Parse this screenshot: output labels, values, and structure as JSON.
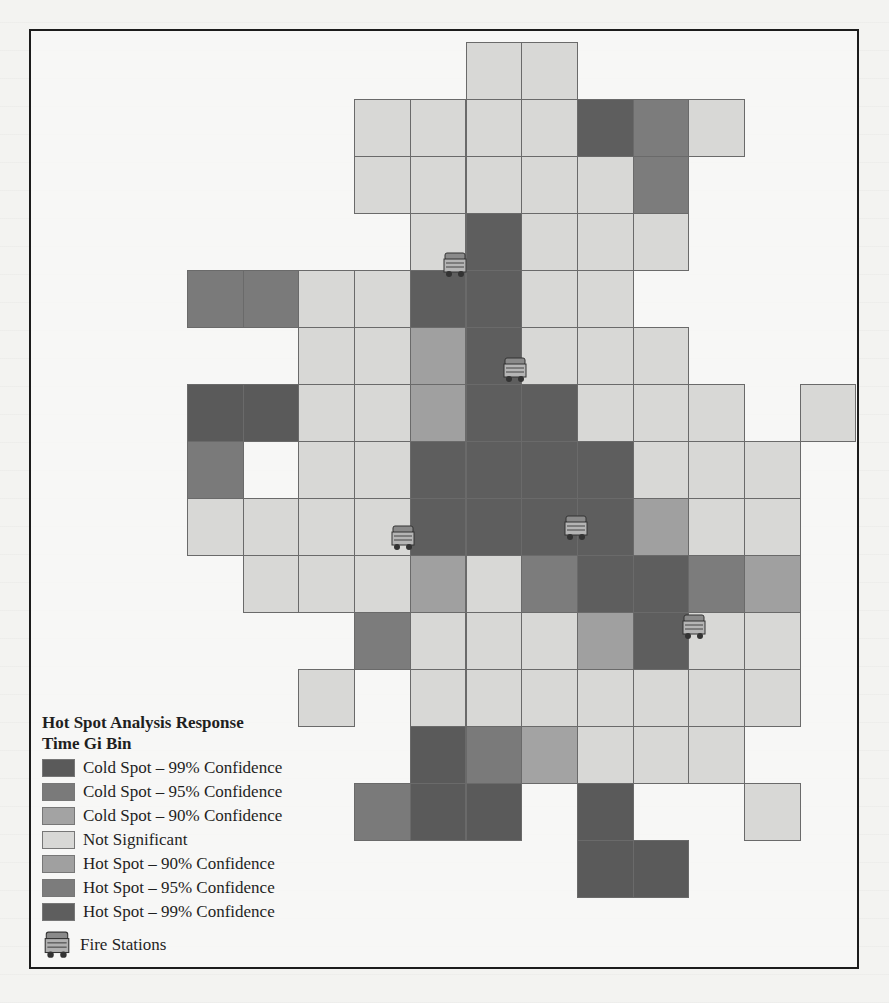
{
  "map": {
    "title": "Hot Spot Analysis Response Time Gi Bin",
    "grid": {
      "origin_x": 187,
      "origin_y": 42,
      "cell_w": 55.7,
      "cell_h": 57
    },
    "classes": {
      "C99": {
        "label": "Cold Spot – 99% Confidence",
        "color": "#5a5a5a"
      },
      "C95": {
        "label": "Cold Spot – 95% Confidence",
        "color": "#7a7a7a"
      },
      "C90": {
        "label": "Cold Spot – 90% Confidence",
        "color": "#a3a3a3"
      },
      "NS": {
        "label": "Not Significant",
        "color": "#d8d8d6"
      },
      "H90": {
        "label": "Hot Spot – 90% Confidence",
        "color": "#a0a0a0"
      },
      "H95": {
        "label": "Hot Spot – 95% Confidence",
        "color": "#7c7c7c"
      },
      "H99": {
        "label": "Hot Spot – 99% Confidence",
        "color": "#5e5e5e"
      }
    },
    "cells": [
      {
        "r": 0,
        "c": 5,
        "k": "NS"
      },
      {
        "r": 0,
        "c": 6,
        "k": "NS"
      },
      {
        "r": 1,
        "c": 3,
        "k": "NS"
      },
      {
        "r": 1,
        "c": 4,
        "k": "NS"
      },
      {
        "r": 1,
        "c": 5,
        "k": "NS"
      },
      {
        "r": 1,
        "c": 6,
        "k": "NS"
      },
      {
        "r": 1,
        "c": 7,
        "k": "H99"
      },
      {
        "r": 1,
        "c": 8,
        "k": "H95"
      },
      {
        "r": 1,
        "c": 9,
        "k": "NS"
      },
      {
        "r": 2,
        "c": 3,
        "k": "NS"
      },
      {
        "r": 2,
        "c": 4,
        "k": "NS"
      },
      {
        "r": 2,
        "c": 5,
        "k": "NS"
      },
      {
        "r": 2,
        "c": 6,
        "k": "NS"
      },
      {
        "r": 2,
        "c": 7,
        "k": "NS"
      },
      {
        "r": 2,
        "c": 8,
        "k": "H95"
      },
      {
        "r": 3,
        "c": 4,
        "k": "NS"
      },
      {
        "r": 3,
        "c": 5,
        "k": "H99"
      },
      {
        "r": 3,
        "c": 6,
        "k": "NS"
      },
      {
        "r": 3,
        "c": 7,
        "k": "NS"
      },
      {
        "r": 3,
        "c": 8,
        "k": "NS"
      },
      {
        "r": 4,
        "c": 0,
        "k": "C95"
      },
      {
        "r": 4,
        "c": 1,
        "k": "C95"
      },
      {
        "r": 4,
        "c": 2,
        "k": "NS"
      },
      {
        "r": 4,
        "c": 3,
        "k": "NS"
      },
      {
        "r": 4,
        "c": 4,
        "k": "H99"
      },
      {
        "r": 4,
        "c": 5,
        "k": "H99"
      },
      {
        "r": 4,
        "c": 6,
        "k": "NS"
      },
      {
        "r": 4,
        "c": 7,
        "k": "NS"
      },
      {
        "r": 5,
        "c": 2,
        "k": "NS"
      },
      {
        "r": 5,
        "c": 3,
        "k": "NS"
      },
      {
        "r": 5,
        "c": 4,
        "k": "H90"
      },
      {
        "r": 5,
        "c": 5,
        "k": "H99"
      },
      {
        "r": 5,
        "c": 6,
        "k": "NS"
      },
      {
        "r": 5,
        "c": 7,
        "k": "NS"
      },
      {
        "r": 5,
        "c": 8,
        "k": "NS"
      },
      {
        "r": 6,
        "c": 0,
        "k": "C99"
      },
      {
        "r": 6,
        "c": 1,
        "k": "C99"
      },
      {
        "r": 6,
        "c": 2,
        "k": "NS"
      },
      {
        "r": 6,
        "c": 3,
        "k": "NS"
      },
      {
        "r": 6,
        "c": 4,
        "k": "H90"
      },
      {
        "r": 6,
        "c": 5,
        "k": "H99"
      },
      {
        "r": 6,
        "c": 6,
        "k": "H99"
      },
      {
        "r": 6,
        "c": 7,
        "k": "NS"
      },
      {
        "r": 6,
        "c": 8,
        "k": "NS"
      },
      {
        "r": 6,
        "c": 9,
        "k": "NS"
      },
      {
        "r": 6,
        "c": 11,
        "k": "NS"
      },
      {
        "r": 7,
        "c": 0,
        "k": "C95"
      },
      {
        "r": 7,
        "c": 2,
        "k": "NS"
      },
      {
        "r": 7,
        "c": 3,
        "k": "NS"
      },
      {
        "r": 7,
        "c": 4,
        "k": "H99"
      },
      {
        "r": 7,
        "c": 5,
        "k": "H99"
      },
      {
        "r": 7,
        "c": 6,
        "k": "H99"
      },
      {
        "r": 7,
        "c": 7,
        "k": "H99"
      },
      {
        "r": 7,
        "c": 8,
        "k": "NS"
      },
      {
        "r": 7,
        "c": 9,
        "k": "NS"
      },
      {
        "r": 7,
        "c": 10,
        "k": "NS"
      },
      {
        "r": 8,
        "c": 0,
        "k": "NS"
      },
      {
        "r": 8,
        "c": 1,
        "k": "NS"
      },
      {
        "r": 8,
        "c": 2,
        "k": "NS"
      },
      {
        "r": 8,
        "c": 3,
        "k": "NS"
      },
      {
        "r": 8,
        "c": 4,
        "k": "H99"
      },
      {
        "r": 8,
        "c": 5,
        "k": "H99"
      },
      {
        "r": 8,
        "c": 6,
        "k": "H99"
      },
      {
        "r": 8,
        "c": 7,
        "k": "H99"
      },
      {
        "r": 8,
        "c": 8,
        "k": "H90"
      },
      {
        "r": 8,
        "c": 9,
        "k": "NS"
      },
      {
        "r": 8,
        "c": 10,
        "k": "NS"
      },
      {
        "r": 9,
        "c": 1,
        "k": "NS"
      },
      {
        "r": 9,
        "c": 2,
        "k": "NS"
      },
      {
        "r": 9,
        "c": 3,
        "k": "NS"
      },
      {
        "r": 9,
        "c": 4,
        "k": "H90"
      },
      {
        "r": 9,
        "c": 5,
        "k": "NS"
      },
      {
        "r": 9,
        "c": 6,
        "k": "H95"
      },
      {
        "r": 9,
        "c": 7,
        "k": "H99"
      },
      {
        "r": 9,
        "c": 8,
        "k": "H99"
      },
      {
        "r": 9,
        "c": 9,
        "k": "H95"
      },
      {
        "r": 9,
        "c": 10,
        "k": "H90"
      },
      {
        "r": 10,
        "c": 3,
        "k": "H95"
      },
      {
        "r": 10,
        "c": 4,
        "k": "NS"
      },
      {
        "r": 10,
        "c": 5,
        "k": "NS"
      },
      {
        "r": 10,
        "c": 6,
        "k": "NS"
      },
      {
        "r": 10,
        "c": 7,
        "k": "H90"
      },
      {
        "r": 10,
        "c": 8,
        "k": "H99"
      },
      {
        "r": 10,
        "c": 9,
        "k": "NS"
      },
      {
        "r": 10,
        "c": 10,
        "k": "NS"
      },
      {
        "r": 11,
        "c": 2,
        "k": "NS"
      },
      {
        "r": 11,
        "c": 4,
        "k": "NS"
      },
      {
        "r": 11,
        "c": 5,
        "k": "NS"
      },
      {
        "r": 11,
        "c": 6,
        "k": "NS"
      },
      {
        "r": 11,
        "c": 7,
        "k": "NS"
      },
      {
        "r": 11,
        "c": 8,
        "k": "NS"
      },
      {
        "r": 11,
        "c": 9,
        "k": "NS"
      },
      {
        "r": 11,
        "c": 10,
        "k": "NS"
      },
      {
        "r": 12,
        "c": 4,
        "k": "C99"
      },
      {
        "r": 12,
        "c": 5,
        "k": "C95"
      },
      {
        "r": 12,
        "c": 6,
        "k": "C90"
      },
      {
        "r": 12,
        "c": 7,
        "k": "NS"
      },
      {
        "r": 12,
        "c": 8,
        "k": "NS"
      },
      {
        "r": 12,
        "c": 9,
        "k": "NS"
      },
      {
        "r": 13,
        "c": 3,
        "k": "C95"
      },
      {
        "r": 13,
        "c": 4,
        "k": "C99"
      },
      {
        "r": 13,
        "c": 5,
        "k": "C99"
      },
      {
        "r": 13,
        "c": 7,
        "k": "C99"
      },
      {
        "r": 13,
        "c": 10,
        "k": "NS"
      },
      {
        "r": 14,
        "c": 7,
        "k": "C99"
      },
      {
        "r": 14,
        "c": 8,
        "k": "C99"
      }
    ],
    "fire_stations": [
      {
        "x": 442,
        "y": 251
      },
      {
        "x": 502,
        "y": 356
      },
      {
        "x": 390,
        "y": 524
      },
      {
        "x": 563,
        "y": 514
      },
      {
        "x": 681,
        "y": 613
      }
    ]
  },
  "legend": {
    "title_line1": "Hot Spot Analysis Response",
    "title_line2": "Time Gi Bin",
    "items": [
      {
        "key": "C99",
        "label": "Cold Spot – 99% Confidence"
      },
      {
        "key": "C95",
        "label": "Cold Spot – 95% Confidence"
      },
      {
        "key": "C90",
        "label": "Cold Spot – 90% Confidence"
      },
      {
        "key": "NS",
        "label": "Not Significant"
      },
      {
        "key": "H90",
        "label": "Hot Spot – 90% Confidence"
      },
      {
        "key": "H95",
        "label": "Hot Spot – 95% Confidence"
      },
      {
        "key": "H99",
        "label": "Hot Spot – 99% Confidence"
      }
    ],
    "fire_stations_label": "Fire Stations"
  }
}
